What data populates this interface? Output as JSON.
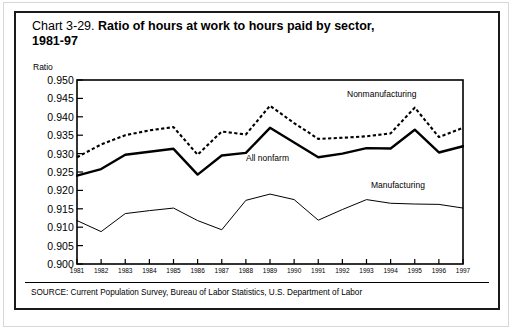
{
  "figure": {
    "chart_number": "Chart 3-29.",
    "title": "Ratio of hours at work to hours paid by sector,",
    "title_second_line": "1981-97",
    "source": "SOURCE: Current Population Survey, Bureau of Labor Statistics, U.S. Department of Labor"
  },
  "chart_data": {
    "type": "line",
    "title": "Ratio of hours at work to hours paid by sector, 1981-97",
    "xlabel": "",
    "ylabel": "Ratio",
    "ylim": [
      0.9,
      0.95
    ],
    "ytick_step": 0.005,
    "grid": false,
    "legend_position": "inline-annotations",
    "ytick_labels": [
      "0.950",
      "0.945",
      "0.940",
      "0.935",
      "0.930",
      "0.925",
      "0.920",
      "0.915",
      "0.910",
      "0.905",
      "0.900"
    ],
    "yticks": [
      0.95,
      0.945,
      0.94,
      0.935,
      0.93,
      0.925,
      0.92,
      0.915,
      0.91,
      0.905,
      0.9
    ],
    "categories": [
      "1981",
      "1982",
      "1983",
      "1984",
      "1985",
      "1986",
      "1987",
      "1988",
      "1989",
      "1990",
      "1991",
      "1992",
      "1993",
      "1994",
      "1995",
      "1996",
      "1997"
    ],
    "x": [
      1981,
      1982,
      1983,
      1984,
      1985,
      1986,
      1987,
      1988,
      1989,
      1990,
      1991,
      1992,
      1993,
      1994,
      1995,
      1996,
      1997
    ],
    "series": [
      {
        "name": "Nonmanufacturing",
        "style": "dotted",
        "color": "#000000",
        "values": [
          0.929,
          0.9325,
          0.935,
          0.9363,
          0.9372,
          0.9297,
          0.936,
          0.9352,
          0.943,
          0.9383,
          0.934,
          0.9343,
          0.9347,
          0.9355,
          0.9425,
          0.9345,
          0.937
        ]
      },
      {
        "name": "All nonfarm",
        "style": "solid-bold",
        "color": "#000000",
        "values": [
          0.924,
          0.9258,
          0.9297,
          0.9305,
          0.9313,
          0.9243,
          0.9295,
          0.9302,
          0.937,
          0.933,
          0.929,
          0.93,
          0.9315,
          0.9314,
          0.9365,
          0.9303,
          0.932
        ]
      },
      {
        "name": "Manufacturing",
        "style": "solid-thin",
        "color": "#000000",
        "values": [
          0.9118,
          0.9088,
          0.9137,
          0.9145,
          0.9152,
          0.9118,
          0.9093,
          0.9173,
          0.919,
          0.9175,
          0.9119,
          0.9148,
          0.9175,
          0.9165,
          0.9163,
          0.9162,
          0.9152
        ]
      }
    ],
    "annotations": [
      {
        "text": "Nonmanufacturing",
        "series": "Nonmanufacturing"
      },
      {
        "text": "All nonfarm",
        "series": "All nonfarm"
      },
      {
        "text": "Manufacturing",
        "series": "Manufacturing"
      }
    ]
  }
}
